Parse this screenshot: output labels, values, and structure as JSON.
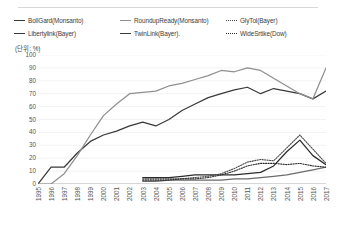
{
  "unit_label": "(단위: %)",
  "legend": {
    "columns": [
      [
        {
          "label": "BollGard(Monsanto)",
          "style": "solid-dark",
          "color": "#3a3a3a",
          "icon": "line-swatch-icon"
        },
        {
          "label": "Libertylink(Bayer)",
          "style": "solid-dark",
          "color": "#3a3a3a",
          "icon": "line-swatch-icon"
        }
      ],
      [
        {
          "label": "RoundupReady(Monsanto)",
          "style": "solid-gray",
          "color": "#8f8f8f",
          "icon": "line-swatch-icon"
        },
        {
          "label": "TwinLink(Bayer).",
          "style": "solid-dark",
          "color": "#3a3a3a",
          "icon": "line-swatch-icon"
        }
      ],
      [
        {
          "label": "GlyTol(Bayer)",
          "style": "dotted",
          "color": "#4a4a4a",
          "icon": "dotted-line-swatch-icon"
        },
        {
          "label": "WideSrtike(Dow)",
          "style": "dotted",
          "color": "#2b2b2b",
          "icon": "dotted-line-swatch-icon"
        }
      ]
    ]
  },
  "chart_data": {
    "type": "line",
    "title": "",
    "subtitle": "",
    "xlabel": "",
    "ylabel": "",
    "unit": "%",
    "ylim": [
      0,
      100
    ],
    "y_ticks": [
      0,
      10,
      20,
      30,
      40,
      50,
      60,
      70,
      80,
      90,
      100
    ],
    "grid": true,
    "legend_position": "top",
    "categories": [
      "1995",
      "1996",
      "1997",
      "1998",
      "1999",
      "2000",
      "2001",
      "2002",
      "2003",
      "2004",
      "2005",
      "2006",
      "2007",
      "2008",
      "2009",
      "2010",
      "2011",
      "2012",
      "2013",
      "2014",
      "2015",
      "2016",
      "2017"
    ],
    "series": [
      {
        "name": "BollGard(Monsanto)",
        "color": "#3a3a3a",
        "style": "solid",
        "values": [
          0,
          13,
          13,
          24,
          33,
          38,
          41,
          45,
          48,
          45,
          50,
          57,
          62,
          67,
          70,
          73,
          75,
          70,
          74,
          72,
          70,
          66,
          72
        ]
      },
      {
        "name": "RoundupReady(Monsanto)",
        "color": "#8f8f8f",
        "style": "solid",
        "values": [
          0,
          0,
          8,
          22,
          38,
          53,
          62,
          70,
          71,
          72,
          76,
          78,
          81,
          84,
          88,
          87,
          90,
          88,
          82,
          76,
          70,
          66,
          90
        ]
      },
      {
        "name": "Libertylink(Bayer)",
        "color": "#6b6b6b",
        "style": "solid",
        "values": [
          null,
          null,
          null,
          null,
          null,
          null,
          null,
          null,
          2,
          2,
          3,
          3,
          3,
          3,
          3,
          4,
          4,
          5,
          6,
          7,
          9,
          11,
          13
        ]
      },
      {
        "name": "TwinLink(Bayer).",
        "color": "#2b2b2b",
        "style": "solid",
        "values": [
          null,
          null,
          null,
          null,
          null,
          null,
          null,
          null,
          5,
          5,
          5,
          6,
          7,
          7,
          7,
          7,
          8,
          9,
          14,
          25,
          34,
          22,
          15
        ]
      },
      {
        "name": "GlyTol(Bayer)",
        "color": "#4a4a4a",
        "style": "dotted",
        "values": [
          null,
          null,
          null,
          null,
          null,
          null,
          null,
          null,
          4,
          4,
          4,
          4,
          5,
          6,
          8,
          12,
          17,
          19,
          18,
          28,
          38,
          27,
          16
        ]
      },
      {
        "name": "WideSrtike(Dow)",
        "color": "#2b2b2b",
        "style": "dotted",
        "values": [
          null,
          null,
          null,
          null,
          null,
          null,
          null,
          null,
          3,
          3,
          3,
          4,
          4,
          5,
          7,
          10,
          14,
          16,
          16,
          15,
          16,
          14,
          13
        ]
      }
    ]
  }
}
